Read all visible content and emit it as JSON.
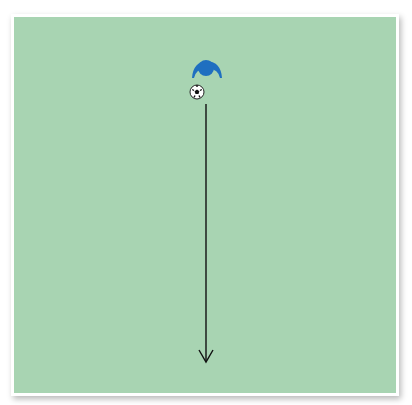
{
  "diagram": {
    "type": "soccer-drill",
    "field": {
      "color": "#a8d4b2",
      "border_color": "#ffffff"
    },
    "player": {
      "color": "#1f6fc0",
      "x": 206,
      "y": 67
    },
    "ball": {
      "x": 197,
      "y": 92
    },
    "arrow": {
      "color": "#111111",
      "from": [
        206,
        104
      ],
      "to": [
        206,
        362
      ],
      "direction": "down"
    }
  }
}
